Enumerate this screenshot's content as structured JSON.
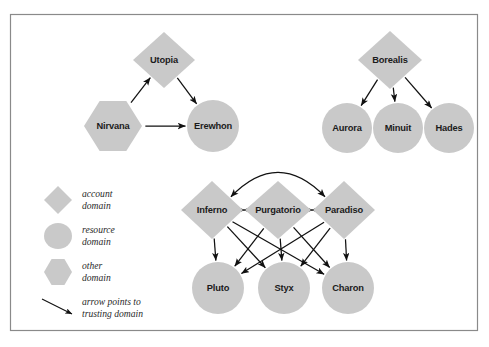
{
  "figure": {
    "background_color": "#ffffff",
    "frame_color": "#8a8a8a",
    "shape_fill": "#c9c9c9",
    "arrow_color": "#111111",
    "label_color": "#1b1b1b"
  },
  "groups": [
    {
      "id": "group-utopia",
      "nodes": [
        {
          "id": "utopia",
          "label": "Utopia",
          "shape": "diamond",
          "cx": 164,
          "cy": 60,
          "w": 62,
          "h": 56
        },
        {
          "id": "nirvana",
          "label": "Nirvana",
          "shape": "hexagon",
          "cx": 113,
          "cy": 126,
          "w": 58,
          "h": 50
        },
        {
          "id": "erewhon",
          "label": "Erewhon",
          "shape": "circle",
          "cx": 213,
          "cy": 126,
          "w": 52,
          "h": 52
        }
      ],
      "edges": [
        {
          "from": "nirvana",
          "to": "utopia",
          "type": "straight",
          "heads": "end"
        },
        {
          "from": "utopia",
          "to": "erewhon",
          "type": "straight",
          "heads": "end"
        },
        {
          "from": "nirvana",
          "to": "erewhon",
          "type": "straight",
          "heads": "end"
        }
      ]
    },
    {
      "id": "group-borealis",
      "nodes": [
        {
          "id": "borealis",
          "label": "Borealis",
          "shape": "diamond",
          "cx": 390,
          "cy": 60,
          "w": 64,
          "h": 58
        },
        {
          "id": "aurora",
          "label": "Aurora",
          "shape": "circle",
          "cx": 347,
          "cy": 128,
          "w": 50,
          "h": 50
        },
        {
          "id": "minuit",
          "label": "Minuit",
          "shape": "circle",
          "cx": 398,
          "cy": 128,
          "w": 50,
          "h": 50
        },
        {
          "id": "hades",
          "label": "Hades",
          "shape": "circle",
          "cx": 449,
          "cy": 128,
          "w": 50,
          "h": 50
        }
      ],
      "edges": [
        {
          "from": "borealis",
          "to": "aurora",
          "type": "straight",
          "heads": "end"
        },
        {
          "from": "borealis",
          "to": "minuit",
          "type": "straight",
          "heads": "end"
        },
        {
          "from": "borealis",
          "to": "hades",
          "type": "straight",
          "heads": "end"
        }
      ]
    },
    {
      "id": "group-inferno",
      "nodes": [
        {
          "id": "inferno",
          "label": "Inferno",
          "shape": "diamond",
          "cx": 212,
          "cy": 210,
          "w": 62,
          "h": 58
        },
        {
          "id": "purgatorio",
          "label": "Purgatorio",
          "shape": "diamond",
          "cx": 278,
          "cy": 210,
          "w": 66,
          "h": 58
        },
        {
          "id": "paradiso",
          "label": "Paradiso",
          "shape": "diamond",
          "cx": 344,
          "cy": 210,
          "w": 62,
          "h": 58
        },
        {
          "id": "pluto",
          "label": "Pluto",
          "shape": "circle",
          "cx": 218,
          "cy": 288,
          "w": 52,
          "h": 52
        },
        {
          "id": "styx",
          "label": "Styx",
          "shape": "circle",
          "cx": 284,
          "cy": 288,
          "w": 52,
          "h": 52
        },
        {
          "id": "charon",
          "label": "Charon",
          "shape": "circle",
          "cx": 348,
          "cy": 288,
          "w": 52,
          "h": 52
        }
      ],
      "edges": [
        {
          "from": "inferno",
          "to": "purgatorio",
          "type": "straight",
          "heads": "both"
        },
        {
          "from": "purgatorio",
          "to": "paradiso",
          "type": "straight",
          "heads": "both"
        },
        {
          "from": "inferno",
          "to": "paradiso",
          "type": "arc",
          "heads": "both"
        },
        {
          "from": "inferno",
          "to": "pluto",
          "type": "straight",
          "heads": "end"
        },
        {
          "from": "inferno",
          "to": "styx",
          "type": "straight",
          "heads": "end"
        },
        {
          "from": "inferno",
          "to": "charon",
          "type": "straight",
          "heads": "end"
        },
        {
          "from": "purgatorio",
          "to": "pluto",
          "type": "straight",
          "heads": "end"
        },
        {
          "from": "purgatorio",
          "to": "styx",
          "type": "straight",
          "heads": "end"
        },
        {
          "from": "purgatorio",
          "to": "charon",
          "type": "straight",
          "heads": "end"
        },
        {
          "from": "paradiso",
          "to": "pluto",
          "type": "straight",
          "heads": "end"
        },
        {
          "from": "paradiso",
          "to": "styx",
          "type": "straight",
          "heads": "end"
        },
        {
          "from": "paradiso",
          "to": "charon",
          "type": "straight",
          "heads": "end"
        }
      ]
    }
  ],
  "legend": {
    "items": [
      {
        "id": "legend-account",
        "shape": "diamond",
        "line1": "account",
        "line2": "domain"
      },
      {
        "id": "legend-resource",
        "shape": "circle",
        "line1": "resource",
        "line2": "domain"
      },
      {
        "id": "legend-other",
        "shape": "hexagon",
        "line1": "other",
        "line2": "domain"
      },
      {
        "id": "legend-arrow",
        "shape": "arrow",
        "line1": "arrow points to",
        "line2": "trusting domain"
      }
    ]
  }
}
